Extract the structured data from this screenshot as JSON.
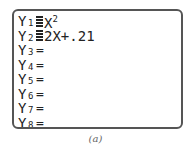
{
  "screen": "Y= editor",
  "functions": [
    {
      "name": "Y",
      "sub": "1",
      "selected": true,
      "expr": "X",
      "power": "2"
    },
    {
      "name": "Y",
      "sub": "2",
      "selected": true,
      "expr": "2X+.21",
      "power": ""
    },
    {
      "name": "Y",
      "sub": "3",
      "selected": false,
      "expr": "",
      "power": ""
    },
    {
      "name": "Y",
      "sub": "4",
      "selected": false,
      "expr": "",
      "power": ""
    },
    {
      "name": "Y",
      "sub": "5",
      "selected": false,
      "expr": "",
      "power": ""
    },
    {
      "name": "Y",
      "sub": "6",
      "selected": false,
      "expr": "",
      "power": ""
    },
    {
      "name": "Y",
      "sub": "7",
      "selected": false,
      "expr": "",
      "power": ""
    },
    {
      "name": "Y",
      "sub": "8",
      "selected": false,
      "expr": "",
      "power": ""
    }
  ],
  "equals_symbol": "=",
  "caption": "(a)",
  "colors": {
    "border": "#555555",
    "text": "#222222"
  }
}
